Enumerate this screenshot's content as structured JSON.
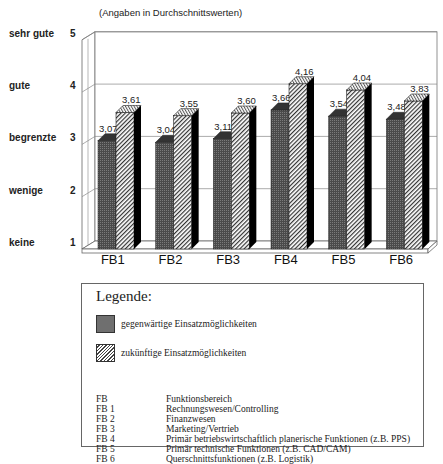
{
  "chart_data": {
    "type": "bar",
    "title": "",
    "subtitle": "(Angaben in Durchschnittswerten)",
    "xlabel": "",
    "ylabel": "",
    "ylim": [
      1,
      5
    ],
    "yticks": [
      1,
      2,
      3,
      4,
      5
    ],
    "ytick_labels": [
      "keine",
      "wenige",
      "begrenzte",
      "gute",
      "sehr gute"
    ],
    "grid": true,
    "style": "3d-grouped-bar",
    "categories": [
      "FB1",
      "FB2",
      "FB3",
      "FB4",
      "FB5",
      "FB6"
    ],
    "series": [
      {
        "name": "gegenwärtige Einsatzmöglichkeiten",
        "pattern": "dark-stipple",
        "values": [
          3.07,
          3.04,
          3.11,
          3.66,
          3.54,
          3.48
        ],
        "labels": [
          "3,07",
          "3,04",
          "3,11",
          "3,66",
          "3,54",
          "3,48"
        ]
      },
      {
        "name": "zukünftige Einsatzmöglichkeiten",
        "pattern": "diagonal-hatch",
        "values": [
          3.61,
          3.55,
          3.6,
          4.16,
          4.04,
          3.83
        ],
        "labels": [
          "3,61",
          "3,55",
          "3,60",
          "4,16",
          "4,04",
          "3,83"
        ]
      }
    ],
    "legend_position": "bottom"
  },
  "chart": {
    "subtitle": "(Angaben in Durchschnittswerten)",
    "y_axis": [
      {
        "value": "5",
        "label": "sehr gute"
      },
      {
        "value": "4",
        "label": "gute"
      },
      {
        "value": "3",
        "label": "begrenzte"
      },
      {
        "value": "2",
        "label": "wenige"
      },
      {
        "value": "1",
        "label": "keine"
      }
    ]
  },
  "legend": {
    "title": "Legende:",
    "items": [
      {
        "label": "gegenwärtige Einsatzmöglichkeiten"
      },
      {
        "label": "zukünftige Einsatzmöglichkeiten"
      }
    ],
    "abbreviations": [
      {
        "key": "FB",
        "value": "Funktionsbereich"
      },
      {
        "key": "FB 1",
        "value": "Rechnungswesen/Controlling"
      },
      {
        "key": "FB 2",
        "value": "Finanzwesen"
      },
      {
        "key": "FB 3",
        "value": "Marketing/Vertrieb"
      },
      {
        "key": "FB 4",
        "value": "Primär betriebswirtschaftlich planerische Funktionen (z.B. PPS)"
      },
      {
        "key": "FB 5",
        "value": "Primär technische Funktionen (z.B. CAD/CAM)"
      },
      {
        "key": "FB 6",
        "value": "Querschnittsfunktionen (z.B. Logistik)"
      }
    ]
  },
  "colors": {
    "current_bar": "#555555",
    "future_bar_hatch": "#444444",
    "bar_side": "#000000",
    "axis_line": "#555555",
    "text": "#111111"
  }
}
